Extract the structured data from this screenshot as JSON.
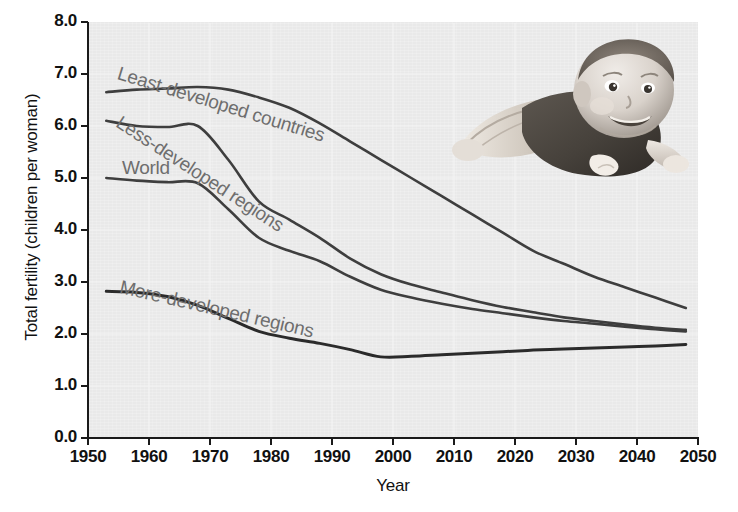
{
  "chart_data": {
    "type": "line",
    "title": "",
    "xlabel": "Year",
    "ylabel": "Total fertility (children per woman)",
    "xlim": [
      1950,
      2050
    ],
    "ylim": [
      0.0,
      8.0
    ],
    "grid": true,
    "legend_position": "inline-curve-labels",
    "ytick_labels": [
      "0.0",
      "1.0",
      "2.0",
      "3.0",
      "4.0",
      "5.0",
      "6.0",
      "7.0",
      "8.0"
    ],
    "ytick_values": [
      0.0,
      1.0,
      2.0,
      3.0,
      4.0,
      5.0,
      6.0,
      7.0,
      8.0
    ],
    "xtick_labels": [
      "1950",
      "1960",
      "1970",
      "1980",
      "1990",
      "2000",
      "2010",
      "2020",
      "2030",
      "2040",
      "2050"
    ],
    "xtick_values": [
      1950,
      1960,
      1970,
      1980,
      1990,
      2000,
      2010,
      2020,
      2030,
      2040,
      2050
    ],
    "x": [
      1953,
      1958,
      1963,
      1968,
      1973,
      1978,
      1983,
      1988,
      1993,
      1998,
      2003,
      2008,
      2013,
      2018,
      2023,
      2028,
      2033,
      2038,
      2043,
      2048
    ],
    "series": [
      {
        "name": "Least-developed countries",
        "label": "Least-developed countries",
        "color": "#3e3e3e",
        "values": [
          6.65,
          6.7,
          6.72,
          6.75,
          6.7,
          6.55,
          6.35,
          6.05,
          5.7,
          5.35,
          5.0,
          4.65,
          4.3,
          3.95,
          3.6,
          3.35,
          3.1,
          2.9,
          2.7,
          2.5
        ]
      },
      {
        "name": "Less-developed regions",
        "label": "Less-developed regions",
        "color": "#3e3e3e",
        "values": [
          6.1,
          6.0,
          5.98,
          6.0,
          5.35,
          4.55,
          4.2,
          3.85,
          3.45,
          3.15,
          2.95,
          2.8,
          2.65,
          2.52,
          2.42,
          2.32,
          2.25,
          2.18,
          2.12,
          2.08
        ]
      },
      {
        "name": "World",
        "label": "World",
        "color": "#3e3e3e",
        "values": [
          5.0,
          4.95,
          4.92,
          4.9,
          4.4,
          3.85,
          3.6,
          3.4,
          3.1,
          2.85,
          2.7,
          2.58,
          2.48,
          2.4,
          2.32,
          2.25,
          2.2,
          2.14,
          2.09,
          2.05
        ]
      },
      {
        "name": "More-developed regions",
        "label": "More-developed regions",
        "color": "#2b2b2b",
        "values": [
          2.82,
          2.8,
          2.72,
          2.55,
          2.3,
          2.05,
          1.92,
          1.82,
          1.7,
          1.56,
          1.57,
          1.6,
          1.63,
          1.66,
          1.69,
          1.71,
          1.73,
          1.75,
          1.77,
          1.8
        ]
      }
    ],
    "annotations": [
      {
        "name": "baby-photo",
        "description": "black and white photograph of a smiling infant lying on its stomach"
      }
    ]
  },
  "axes": {
    "y_title": "Total fertility (children per woman)",
    "x_title": "Year"
  },
  "curve_labels": {
    "least": "Least-developed countries",
    "less": "Less-developed regions",
    "world": "World",
    "more": "More-developed regions"
  },
  "footer": {
    "faint_caption": ""
  },
  "colors": {
    "plot_background": "#e9e9e9",
    "line": "#3e3e3e",
    "line_dark": "#2b2b2b",
    "label_text": "#6e6e6e",
    "axis_text": "#111111",
    "grid": "#f3f3f3"
  }
}
